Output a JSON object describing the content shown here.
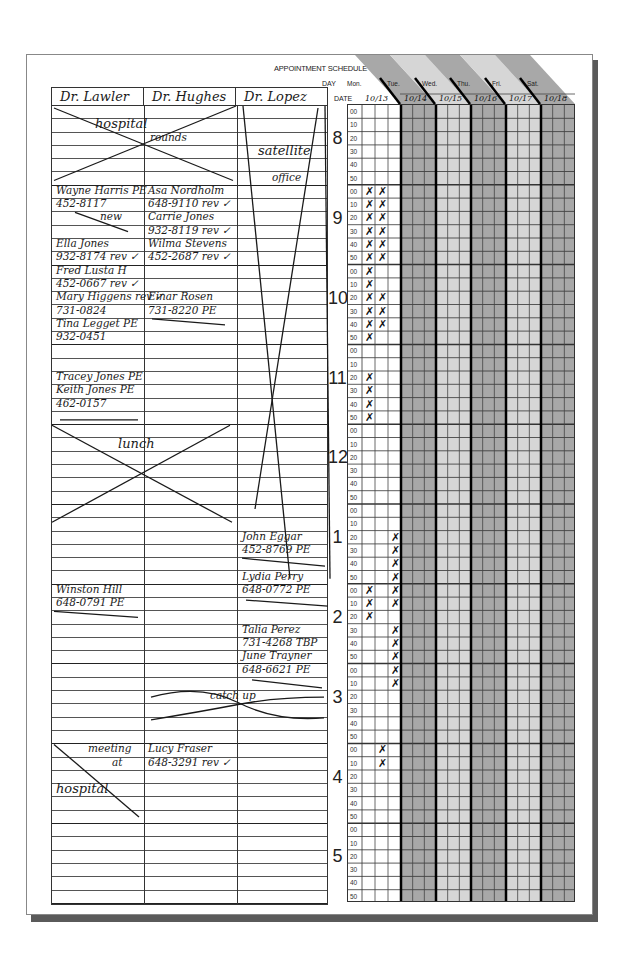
{
  "form": {
    "title": "APPOINTMENT SCHEDULE",
    "day_label": "DAY",
    "date_label": "DATE"
  },
  "days": [
    {
      "name": "Mon.",
      "date": "10/13",
      "shade": "#ffffff"
    },
    {
      "name": "Tue.",
      "date": "10/14",
      "shade": "#a8a8a8"
    },
    {
      "name": "Wed.",
      "date": "10/15",
      "shade": "#d6d6d6"
    },
    {
      "name": "Thu.",
      "date": "10/16",
      "shade": "#a8a8a8"
    },
    {
      "name": "Fri.",
      "date": "10/17",
      "shade": "#d6d6d6"
    },
    {
      "name": "Sat.",
      "date": "10/18",
      "shade": "#a8a8a8"
    }
  ],
  "doctors": [
    "Dr. Lawler",
    "Dr. Hughes",
    "Dr. Lopez"
  ],
  "hours": [
    "8",
    "9",
    "10",
    "11",
    "12",
    "1",
    "2",
    "3",
    "4",
    "5"
  ],
  "minutes": [
    "00",
    "10",
    "20",
    "30",
    "40",
    "50"
  ],
  "entries": {
    "lawler": [
      {
        "row": 1,
        "text": "hospital",
        "note": "blocked (crossed out)"
      },
      {
        "row": 6,
        "text": "Wayne Harris PE"
      },
      {
        "row": 7,
        "text": "452-8117"
      },
      {
        "row": 8,
        "text": "new"
      },
      {
        "row": 10,
        "text": "Ella Jones"
      },
      {
        "row": 11,
        "text": "932-8174 rev ✓"
      },
      {
        "row": 12,
        "text": "Fred Lusta H"
      },
      {
        "row": 13,
        "text": "452-0667 rev ✓"
      },
      {
        "row": 14,
        "text": "Mary Higgens rev ✓"
      },
      {
        "row": 15,
        "text": "731-0824"
      },
      {
        "row": 16,
        "text": "Tina Legget PE"
      },
      {
        "row": 17,
        "text": "932-0451"
      },
      {
        "row": 20,
        "text": "Tracey Jones PE"
      },
      {
        "row": 21,
        "text": "Keith Jones PE"
      },
      {
        "row": 22,
        "text": "462-0157"
      },
      {
        "row": 25,
        "text": "lunch",
        "note": "blocked (crossed out)"
      },
      {
        "row": 36,
        "text": "Winston Hill"
      },
      {
        "row": 37,
        "text": "648-0791 PE"
      },
      {
        "row": 48,
        "text": "meeting"
      },
      {
        "row": 49,
        "text": "at"
      },
      {
        "row": 51,
        "text": "hospital"
      }
    ],
    "hughes": [
      {
        "row": 2,
        "text": "rounds",
        "note": "blocked (crossed out)"
      },
      {
        "row": 6,
        "text": "Asa Nordholm"
      },
      {
        "row": 7,
        "text": "648-9110 rev ✓"
      },
      {
        "row": 8,
        "text": "Carrie Jones"
      },
      {
        "row": 9,
        "text": "932-8119 rev ✓"
      },
      {
        "row": 10,
        "text": "Wilma Stevens"
      },
      {
        "row": 11,
        "text": "452-2687 rev ✓"
      },
      {
        "row": 14,
        "text": "Einar Rosen"
      },
      {
        "row": 15,
        "text": "731-8220 PE"
      },
      {
        "row": 44,
        "text": "catch up",
        "note": "blocked (crossed out)"
      },
      {
        "row": 48,
        "text": "Lucy Fraser"
      },
      {
        "row": 49,
        "text": "648-3291 rev ✓"
      }
    ],
    "lopez": [
      {
        "row": 3,
        "text": "satellite"
      },
      {
        "row": 5,
        "text": "office",
        "note": "blocked 8:00–1:10"
      },
      {
        "row": 32,
        "text": "John Eggar"
      },
      {
        "row": 33,
        "text": "452-8769 PE"
      },
      {
        "row": 35,
        "text": "Lydia Perry"
      },
      {
        "row": 36,
        "text": "648-0772 PE"
      },
      {
        "row": 39,
        "text": "Talia Perez"
      },
      {
        "row": 40,
        "text": "731-4268 TBP"
      },
      {
        "row": 41,
        "text": "June Trayner"
      },
      {
        "row": 42,
        "text": "648-6621 PE"
      }
    ]
  },
  "mon_marks": {
    "col1": [
      6,
      7,
      8,
      9,
      10,
      11,
      12,
      13,
      14,
      15,
      16,
      17,
      20,
      21,
      22,
      23,
      36,
      37,
      38
    ],
    "col2": [
      6,
      7,
      8,
      9,
      10,
      11,
      14,
      15,
      16,
      48,
      49
    ],
    "col3": [
      32,
      33,
      34,
      35,
      36,
      37,
      39,
      40,
      41,
      42,
      43
    ]
  }
}
